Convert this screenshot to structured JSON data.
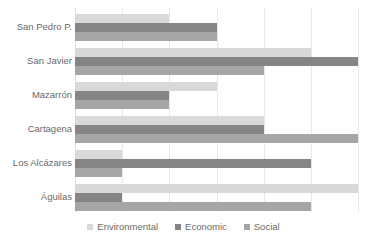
{
  "chart_data": {
    "type": "bar",
    "orientation": "horizontal",
    "title": "",
    "subtitle": "",
    "xlabel": "",
    "ylabel": "",
    "xlim": [
      0,
      60
    ],
    "ylim": null,
    "grid": true,
    "grid_axis": "x",
    "gridline_values": [
      10,
      20,
      30,
      40,
      50,
      60
    ],
    "legend_position": "bottom",
    "categories": [
      "San Pedro P.",
      "San Javier",
      "Mazarrón",
      "Cartagena",
      "Los Alcázares",
      "Águilas"
    ],
    "series": [
      {
        "name": "Environmental",
        "color": "#d9d9d9",
        "values": [
          20,
          50,
          30,
          40,
          10,
          60
        ]
      },
      {
        "name": "Economic",
        "color": "#858585",
        "values": [
          30,
          60,
          20,
          40,
          50,
          10
        ]
      },
      {
        "name": "Social",
        "color": "#a6a6a6",
        "values": [
          30,
          40,
          20,
          60,
          10,
          50
        ]
      }
    ]
  },
  "legend": {
    "items": [
      {
        "label": "Environmental",
        "color": "#d9d9d9"
      },
      {
        "label": "Economic",
        "color": "#858585"
      },
      {
        "label": "Social",
        "color": "#a6a6a6"
      }
    ]
  },
  "colors": {
    "background": "#ffffff",
    "gridline": "#e8e8e8",
    "text": "#6a6a6a"
  }
}
